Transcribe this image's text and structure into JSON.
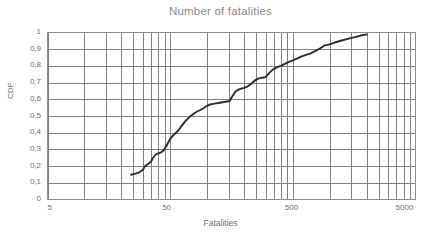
{
  "chart_data": {
    "type": "line",
    "title": "Number of fatalities",
    "xlabel": "Fatalities",
    "ylabel": "CDF",
    "xscale": "log",
    "xlim": [
      5,
      5000
    ],
    "ylim": [
      0,
      1
    ],
    "grid": true,
    "legend": null,
    "x_tick_labels": [
      "5",
      "50",
      "500",
      "5000"
    ],
    "x_tick_values": [
      5,
      50,
      500,
      5000
    ],
    "y_tick_labels": [
      "0",
      "0,1",
      "0,2",
      "0,3",
      "0,4",
      "0,5",
      "0,6",
      "0,7",
      "0,8",
      "0,9",
      "1"
    ],
    "y_tick_values": [
      0,
      0.1,
      0.2,
      0.3,
      0.4,
      0.5,
      0.6,
      0.7,
      0.8,
      0.9,
      1
    ],
    "series_name": "CDF of fatalities",
    "line_color": "#2b2b2b",
    "grid_color": "#808080",
    "x": [
      24,
      26,
      28,
      30,
      31,
      33,
      35,
      36,
      38,
      40,
      42,
      44,
      46,
      48,
      50,
      53,
      56,
      59,
      62,
      66,
      70,
      74,
      78,
      83,
      88,
      94,
      100,
      106,
      112,
      118,
      124,
      130,
      137,
      145,
      153,
      160,
      170,
      180,
      190,
      200,
      215,
      230,
      245,
      260,
      280,
      300,
      320,
      345,
      370,
      400,
      430,
      465,
      500,
      545,
      590,
      640,
      700,
      760,
      830,
      900,
      1000,
      1100,
      1250,
      1400,
      1600,
      1800,
      2000
    ],
    "y": [
      0.148,
      0.155,
      0.163,
      0.178,
      0.197,
      0.213,
      0.228,
      0.247,
      0.268,
      0.277,
      0.281,
      0.292,
      0.312,
      0.338,
      0.362,
      0.385,
      0.401,
      0.418,
      0.441,
      0.466,
      0.486,
      0.502,
      0.515,
      0.527,
      0.536,
      0.548,
      0.561,
      0.569,
      0.573,
      0.576,
      0.578,
      0.581,
      0.584,
      0.587,
      0.59,
      0.617,
      0.645,
      0.658,
      0.664,
      0.668,
      0.678,
      0.695,
      0.712,
      0.724,
      0.729,
      0.733,
      0.757,
      0.779,
      0.791,
      0.8,
      0.812,
      0.824,
      0.833,
      0.845,
      0.857,
      0.866,
      0.875,
      0.888,
      0.904,
      0.921,
      0.929,
      0.94,
      0.952,
      0.962,
      0.972,
      0.982,
      0.989
    ],
    "annotations": []
  }
}
